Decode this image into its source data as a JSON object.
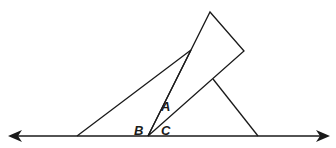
{
  "diagram": {
    "stroke_color": "#1a1a1a",
    "background": "#ffffff",
    "line": {
      "x1": 12,
      "y1": 136,
      "x2": 326,
      "y2": 136,
      "arrows": "both"
    },
    "left_triangle": [
      [
        77,
        136
      ],
      [
        191,
        50
      ],
      [
        148,
        136
      ]
    ],
    "rectangle": [
      [
        148,
        136
      ],
      [
        210,
        12
      ],
      [
        244,
        51
      ],
      [
        148,
        136
      ]
    ],
    "right_segment": {
      "x1": 213,
      "y1": 79,
      "x2": 258,
      "y2": 136
    },
    "labels": [
      {
        "text": "A",
        "x": 161,
        "y": 111
      },
      {
        "text": "B",
        "x": 134,
        "y": 135
      },
      {
        "text": "C",
        "x": 161,
        "y": 135
      }
    ]
  }
}
